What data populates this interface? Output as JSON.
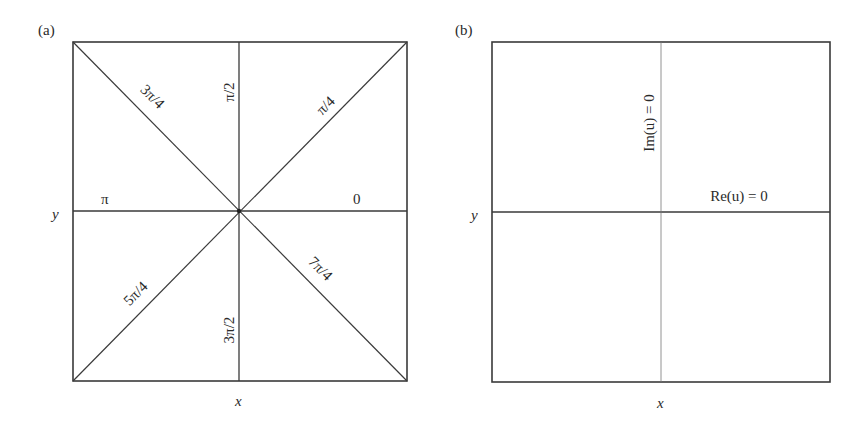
{
  "panels": [
    {
      "id": "a",
      "label": "(a)",
      "x_axis_label": "x",
      "y_axis_label": "y",
      "line_labels": {
        "zero": "0",
        "pi_over_4": "π/4",
        "pi_over_2": "π/2",
        "three_pi_over_4": "3π/4",
        "pi": "π",
        "five_pi_over_4": "5π/4",
        "three_pi_over_2": "3π/2",
        "seven_pi_over_4": "7π/4"
      }
    },
    {
      "id": "b",
      "label": "(b)",
      "x_axis_label": "x",
      "y_axis_label": "y",
      "line_labels": {
        "im_zero": "Im(u) = 0",
        "re_zero": "Re(u) = 0"
      }
    }
  ],
  "colors": {
    "line": "#3a3a3a",
    "text": "#2a2a2a",
    "background": "#ffffff"
  }
}
